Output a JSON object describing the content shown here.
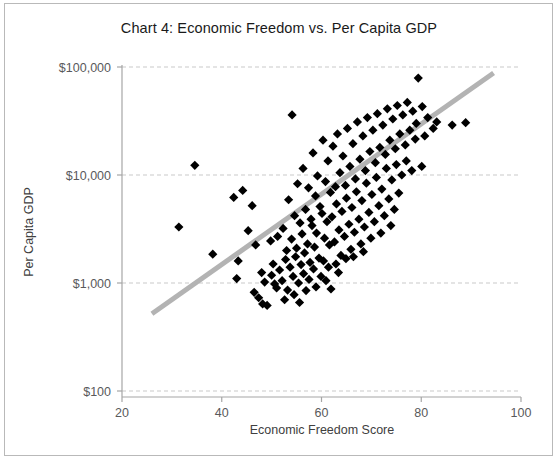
{
  "chart_data": {
    "type": "scatter",
    "title": "Chart 4: Economic Freedom vs. Per Capita GDP",
    "xlabel": "Economic Freedom Score",
    "ylabel": "Per Capita GDP",
    "xlim": [
      20,
      100
    ],
    "ylim": [
      100,
      100000
    ],
    "yscale": "log",
    "xscale": "linear",
    "xticks": [
      20,
      40,
      60,
      80,
      100
    ],
    "xtick_labels": [
      "20",
      "40",
      "60",
      "80",
      "100"
    ],
    "yticks": [
      100,
      1000,
      10000,
      100000
    ],
    "ytick_labels": [
      "$100",
      "$1,000",
      "$10,000",
      "$100,000"
    ],
    "grid": "horizontal-dashed",
    "legend": "none",
    "marker": "diamond",
    "marker_color": "#000000",
    "trendline": {
      "label": "linear fit (log scale)",
      "color": "#b3b3b3",
      "width": 5,
      "x_start": 26.0,
      "y_start": 520,
      "x_end": 94.5,
      "y_end": 88000
    },
    "points": [
      [
        34.6,
        12300
      ],
      [
        31.4,
        3300
      ],
      [
        38.2,
        1850
      ],
      [
        42.4,
        6200
      ],
      [
        43.3,
        1600
      ],
      [
        43.0,
        1100
      ],
      [
        44.2,
        7200
      ],
      [
        45.3,
        3050
      ],
      [
        46.1,
        5200
      ],
      [
        46.8,
        2250
      ],
      [
        46.5,
        820
      ],
      [
        47.4,
        730
      ],
      [
        48.0,
        1250
      ],
      [
        48.6,
        1020
      ],
      [
        48.2,
        640
      ],
      [
        49.1,
        620
      ],
      [
        49.8,
        2450
      ],
      [
        50.3,
        1500
      ],
      [
        50.6,
        980
      ],
      [
        50.0,
        1180
      ],
      [
        51.2,
        2700
      ],
      [
        51.6,
        1320
      ],
      [
        51.0,
        900
      ],
      [
        52.3,
        3200
      ],
      [
        52.8,
        1650
      ],
      [
        52.1,
        1050
      ],
      [
        52.6,
        700
      ],
      [
        53.4,
        5900
      ],
      [
        53.0,
        2000
      ],
      [
        53.7,
        1400
      ],
      [
        53.2,
        860
      ],
      [
        54.1,
        36000
      ],
      [
        54.6,
        4200
      ],
      [
        54.0,
        2550
      ],
      [
        54.8,
        1750
      ],
      [
        54.3,
        1150
      ],
      [
        54.5,
        780
      ],
      [
        55.2,
        8300
      ],
      [
        55.7,
        3600
      ],
      [
        55.0,
        2100
      ],
      [
        55.9,
        1480
      ],
      [
        55.4,
        1000
      ],
      [
        55.6,
        660
      ],
      [
        56.3,
        11500
      ],
      [
        56.8,
        4800
      ],
      [
        56.1,
        2850
      ],
      [
        56.6,
        1900
      ],
      [
        56.4,
        1220
      ],
      [
        56.9,
        850
      ],
      [
        57.4,
        7600
      ],
      [
        57.9,
        3900
      ],
      [
        57.2,
        2300
      ],
      [
        57.7,
        1550
      ],
      [
        57.5,
        1080
      ],
      [
        58.3,
        16000
      ],
      [
        58.8,
        6400
      ],
      [
        58.1,
        3400
      ],
      [
        58.6,
        2150
      ],
      [
        58.4,
        1350
      ],
      [
        58.9,
        920
      ],
      [
        59.2,
        9800
      ],
      [
        59.7,
        5100
      ],
      [
        59.0,
        2900
      ],
      [
        59.5,
        1700
      ],
      [
        59.9,
        1150
      ],
      [
        60.3,
        21000
      ],
      [
        60.8,
        8700
      ],
      [
        60.1,
        4400
      ],
      [
        60.6,
        2600
      ],
      [
        60.4,
        1600
      ],
      [
        60.9,
        1050
      ],
      [
        61.3,
        13500
      ],
      [
        61.8,
        6900
      ],
      [
        61.1,
        3700
      ],
      [
        61.6,
        2250
      ],
      [
        61.4,
        1400
      ],
      [
        61.9,
        880
      ],
      [
        62.3,
        18500
      ],
      [
        62.8,
        7800
      ],
      [
        62.1,
        4100
      ],
      [
        62.6,
        2400
      ],
      [
        62.9,
        1500
      ],
      [
        63.2,
        24000
      ],
      [
        63.7,
        10500
      ],
      [
        63.0,
        5400
      ],
      [
        63.5,
        3100
      ],
      [
        63.9,
        1800
      ],
      [
        63.4,
        1250
      ],
      [
        64.3,
        15000
      ],
      [
        64.8,
        8000
      ],
      [
        64.1,
        4600
      ],
      [
        64.6,
        2700
      ],
      [
        64.9,
        1680
      ],
      [
        65.2,
        27000
      ],
      [
        65.7,
        12000
      ],
      [
        65.0,
        6100
      ],
      [
        65.5,
        3500
      ],
      [
        65.9,
        2050
      ],
      [
        66.3,
        19500
      ],
      [
        66.8,
        9200
      ],
      [
        66.1,
        5000
      ],
      [
        66.6,
        2950
      ],
      [
        66.4,
        1750
      ],
      [
        67.2,
        31000
      ],
      [
        67.7,
        14000
      ],
      [
        67.0,
        7000
      ],
      [
        67.5,
        3900
      ],
      [
        67.9,
        2300
      ],
      [
        68.3,
        23000
      ],
      [
        68.8,
        11000
      ],
      [
        68.1,
        5800
      ],
      [
        68.6,
        3300
      ],
      [
        68.4,
        1950
      ],
      [
        69.2,
        34000
      ],
      [
        69.7,
        16500
      ],
      [
        69.0,
        8400
      ],
      [
        69.5,
        4500
      ],
      [
        69.9,
        2600
      ],
      [
        70.3,
        26000
      ],
      [
        70.8,
        13000
      ],
      [
        70.1,
        6600
      ],
      [
        70.6,
        3700
      ],
      [
        71.2,
        37000
      ],
      [
        71.7,
        18000
      ],
      [
        71.0,
        9500
      ],
      [
        71.5,
        5200
      ],
      [
        71.9,
        2900
      ],
      [
        72.3,
        29000
      ],
      [
        72.8,
        15500
      ],
      [
        72.1,
        7400
      ],
      [
        72.6,
        4200
      ],
      [
        73.2,
        41000
      ],
      [
        73.7,
        21000
      ],
      [
        73.0,
        11500
      ],
      [
        73.5,
        6000
      ],
      [
        73.9,
        3400
      ],
      [
        74.3,
        33000
      ],
      [
        74.8,
        17500
      ],
      [
        74.1,
        9000
      ],
      [
        74.6,
        4800
      ],
      [
        75.2,
        44000
      ],
      [
        75.7,
        24000
      ],
      [
        75.0,
        12500
      ],
      [
        75.5,
        6800
      ],
      [
        76.3,
        36000
      ],
      [
        76.8,
        19000
      ],
      [
        76.1,
        10000
      ],
      [
        77.2,
        47000
      ],
      [
        77.7,
        26000
      ],
      [
        77.0,
        13500
      ],
      [
        78.3,
        39000
      ],
      [
        78.8,
        21500
      ],
      [
        78.1,
        11000
      ],
      [
        79.4,
        79000
      ],
      [
        79.0,
        30000
      ],
      [
        80.2,
        43000
      ],
      [
        80.7,
        23000
      ],
      [
        80.1,
        12000
      ],
      [
        81.3,
        34000
      ],
      [
        82.4,
        27000
      ],
      [
        83.1,
        31000
      ],
      [
        86.2,
        29000
      ],
      [
        88.9,
        30500
      ]
    ]
  },
  "colors": {
    "marker": "#000000",
    "trendline": "#b3b3b3",
    "gridline": "#c9c9c9",
    "axis": "#a6a6a6",
    "text": "#404040",
    "title": "#1a1a1a",
    "border": "#b9b9b9"
  }
}
